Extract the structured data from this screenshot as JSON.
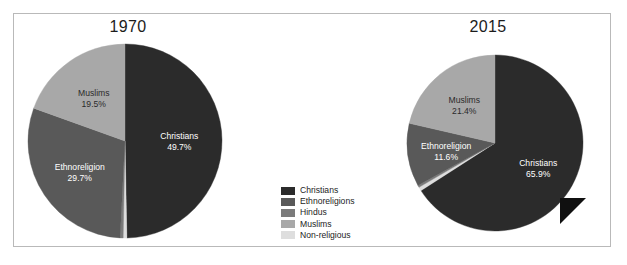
{
  "figure": {
    "background_color": "#ffffff",
    "frame_border_color": "#b9b9b9"
  },
  "legend": {
    "position": "bottom-center",
    "items": [
      {
        "label": "Christians",
        "color": "#2b2b2b"
      },
      {
        "label": "Ethnoreligions",
        "color": "#595959"
      },
      {
        "label": "Hindus",
        "color": "#7b7b7b"
      },
      {
        "label": "Muslims",
        "color": "#a8a8a8"
      },
      {
        "label": "Non-religious",
        "color": "#dedede"
      }
    ]
  },
  "charts": [
    {
      "id": "pie-1970",
      "title": "1970",
      "slices": [
        {
          "name": "Christians",
          "value": 49.7,
          "color": "#2b2b2b",
          "label": "Christians",
          "value_label": "49.7%",
          "label_color": "light",
          "show_label": true
        },
        {
          "name": "Non-religious",
          "value": 0.6,
          "color": "#dedede",
          "label": "Non-religious",
          "value_label": "0.6%",
          "label_color": "dark",
          "show_label": false
        },
        {
          "name": "Hindus",
          "value": 0.5,
          "color": "#7b7b7b",
          "label": "Hindus",
          "value_label": "0.5%",
          "label_color": "dark",
          "show_label": false
        },
        {
          "name": "Ethnoreligions",
          "value": 29.7,
          "color": "#595959",
          "label": "Ethnoreligion",
          "value_label": "29.7%",
          "label_color": "light",
          "show_label": true
        },
        {
          "name": "Muslims",
          "value": 19.5,
          "color": "#a8a8a8",
          "label": "Muslims",
          "value_label": "19.5%",
          "label_color": "dark",
          "show_label": true
        }
      ]
    },
    {
      "id": "pie-2015",
      "title": "2015",
      "slices": [
        {
          "name": "Christians",
          "value": 65.9,
          "color": "#2b2b2b",
          "label": "Christians",
          "value_label": "65.9%",
          "label_color": "light",
          "show_label": true
        },
        {
          "name": "Non-religious",
          "value": 0.7,
          "color": "#dedede",
          "label": "Non-religious",
          "value_label": "0.7%",
          "label_color": "dark",
          "show_label": false
        },
        {
          "name": "Hindus",
          "value": 0.4,
          "color": "#7b7b7b",
          "label": "Hindus",
          "value_label": "0.4%",
          "label_color": "dark",
          "show_label": false
        },
        {
          "name": "Ethnoreligions",
          "value": 11.6,
          "color": "#595959",
          "label": "Ethnoreligion",
          "value_label": "11.6%",
          "label_color": "light",
          "show_label": true
        },
        {
          "name": "Muslims",
          "value": 21.4,
          "color": "#a8a8a8",
          "label": "Muslims",
          "value_label": "21.4%",
          "label_color": "dark",
          "show_label": true
        }
      ]
    }
  ],
  "chart_data": {
    "type": "pie",
    "title": "",
    "subtitle": "",
    "xlabel": "",
    "ylabel": "",
    "grid": false,
    "legend_position": "bottom-center",
    "legend_entries": [
      "Christians",
      "Ethnoreligions",
      "Hindus",
      "Muslims",
      "Non-religious"
    ],
    "units": "percent",
    "start_angle_deg": 0,
    "direction": "clockwise",
    "panels": [
      {
        "title": "1970",
        "categories": [
          "Christians",
          "Ethnoreligions",
          "Muslims"
        ],
        "values": [
          49.7,
          29.7,
          19.5
        ],
        "annotations": [
          "Christians 49.7%",
          "Ethnoreligion 29.7%",
          "Muslims 19.5%"
        ]
      },
      {
        "title": "2015",
        "categories": [
          "Christians",
          "Ethnoreligions",
          "Muslims"
        ],
        "values": [
          65.9,
          11.6,
          21.4
        ],
        "annotations": [
          "Christians 65.9%",
          "Ethnoreligion 11.6%",
          "Muslims 21.4%"
        ]
      }
    ]
  }
}
